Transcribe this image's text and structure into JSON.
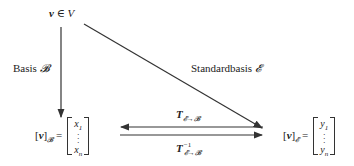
{
  "diagram": {
    "top_node": {
      "vector": "v",
      "relation": "∈",
      "space": "V"
    },
    "left_edge_label": {
      "text": "Basis",
      "symbol": "𝓑"
    },
    "diagonal_edge_label": {
      "text": "Standardbasis",
      "symbol": "𝓔"
    },
    "left_node": {
      "vector": "v",
      "subscript": "𝓑",
      "equals": "=",
      "entries": [
        "x",
        "x"
      ],
      "entry_subscripts": [
        "1",
        "n"
      ]
    },
    "right_node": {
      "vector": "v",
      "subscript": "𝓔",
      "equals": "=",
      "entries": [
        "y",
        "y"
      ],
      "entry_subscripts": [
        "1",
        "n"
      ]
    },
    "upper_arrow_label": {
      "symbol": "T",
      "subscript": "𝓔→𝓑"
    },
    "lower_arrow_label": {
      "symbol": "T",
      "superscript": "−1",
      "subscript": "𝓔→𝓑"
    },
    "colors": {
      "line": "#333333",
      "text": "#222222",
      "background": "#ffffff"
    }
  }
}
